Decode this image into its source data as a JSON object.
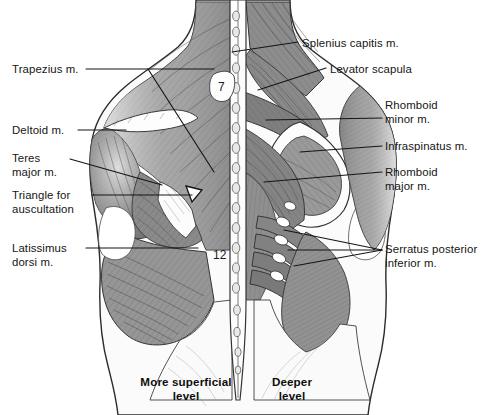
{
  "figure": {
    "background_color": "#ffffff",
    "ink_color": "#1a1a1a"
  },
  "labels_left": [
    {
      "name": "trapezius",
      "text": "Trapezius m.",
      "x": 12,
      "y": 63,
      "lines": 1
    },
    {
      "name": "deltoid",
      "text": "Deltoid m.",
      "x": 12,
      "y": 124,
      "lines": 1
    },
    {
      "name": "teres-major",
      "text": "Teres\nmajor m.",
      "x": 12,
      "y": 152,
      "lines": 2
    },
    {
      "name": "triangle-auscultation",
      "text": "Triangle for\nauscultation",
      "x": 12,
      "y": 189,
      "lines": 2
    },
    {
      "name": "latissimus-dorsi",
      "text": "Latissimus\ndorsi m.",
      "x": 12,
      "y": 242,
      "lines": 2
    }
  ],
  "labels_right": [
    {
      "name": "splenius-capitis",
      "text": "Splenius capitis m.",
      "x": 302,
      "y": 37,
      "lines": 1
    },
    {
      "name": "levator-scapula",
      "text": "Levator scapula",
      "x": 330,
      "y": 63,
      "lines": 1
    },
    {
      "name": "rhomboid-minor",
      "text": "Rhomboid\nminor m.",
      "x": 385,
      "y": 99,
      "lines": 2
    },
    {
      "name": "infraspinatus",
      "text": "Infraspinatus m.",
      "x": 385,
      "y": 140,
      "lines": 1
    },
    {
      "name": "rhomboid-major",
      "text": "Rhomboid\nmajor m.",
      "x": 385,
      "y": 166,
      "lines": 2
    },
    {
      "name": "serratus-posterior-inf",
      "text": "Serratus posterior\ninferior m.",
      "x": 385,
      "y": 243,
      "lines": 2
    }
  ],
  "vertebral_markers": [
    {
      "name": "c7-marker",
      "text": "7",
      "x": 218,
      "y": 86,
      "meaning": "C7 spinous process"
    },
    {
      "name": "t12-marker",
      "text": "12",
      "x": 215,
      "y": 254,
      "meaning": "T12 spinous process"
    }
  ],
  "captions": [
    {
      "name": "more-superficial-level",
      "text": "More superficial\nlevel",
      "x": 126,
      "y": 375
    },
    {
      "name": "deeper-level",
      "text": "Deeper\nlevel",
      "x": 257,
      "y": 375
    }
  ],
  "leaders_left": [
    {
      "name": "leader-trapezius",
      "points": "86,69 215,69 215,69"
    },
    {
      "name": "leader-trapezius-diagonal",
      "points": "148,69 215,170"
    },
    {
      "name": "leader-deltoid",
      "points": "78,129 124,129"
    },
    {
      "name": "leader-teres-major",
      "points": "72,158 160,183"
    },
    {
      "name": "leader-triangle",
      "points": "92,194 190,194"
    },
    {
      "name": "leader-latissimus",
      "points": "86,247 197,247"
    }
  ],
  "leaders_right": [
    {
      "name": "leader-splenius",
      "points": "282,42 233,50"
    },
    {
      "name": "leader-levator",
      "points": "327,68 258,88"
    },
    {
      "name": "leader-rhomboid-minor",
      "points": "380,118 266,119"
    },
    {
      "name": "leader-infraspinatus",
      "points": "380,145 300,150"
    },
    {
      "name": "leader-rhomboid-major",
      "points": "380,172 265,180"
    },
    {
      "name": "leader-serratus-a",
      "points": "380,249 283,232"
    },
    {
      "name": "leader-serratus-b",
      "points": "380,249 290,250"
    },
    {
      "name": "leader-serratus-c",
      "points": "380,249 296,263"
    }
  ]
}
